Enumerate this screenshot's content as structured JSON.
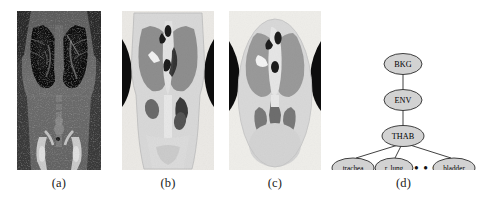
{
  "figure": {
    "panels": [
      {
        "id": "a",
        "caption": "(a)",
        "description": "original coronal CT slice of human torso",
        "kind": "grayscale-ct"
      },
      {
        "id": "b",
        "caption": "(b)",
        "description": "segmented coronal CT slice with labeled regions",
        "kind": "segmentation"
      },
      {
        "id": "c",
        "caption": "(c)",
        "description": "idealized smoothed anatomical segmentation",
        "kind": "idealized-segmentation"
      },
      {
        "id": "d",
        "caption": "(d)",
        "description": "anatomical hierarchy tree",
        "kind": "tree-diagram"
      }
    ]
  },
  "tree": {
    "nodes": [
      {
        "id": "bkg",
        "label": "BKG",
        "level": 0
      },
      {
        "id": "env",
        "label": "ENV",
        "level": 1
      },
      {
        "id": "thab",
        "label": "THAB",
        "level": 2
      },
      {
        "id": "trachea",
        "label": "trachea",
        "level": 3
      },
      {
        "id": "rlung",
        "label": "r. lung",
        "level": 3
      },
      {
        "id": "more",
        "label": "• • •",
        "level": 3
      },
      {
        "id": "bladder",
        "label": "bladder",
        "level": 3
      }
    ],
    "edges": [
      {
        "from": "bkg",
        "to": "env"
      },
      {
        "from": "env",
        "to": "thab"
      },
      {
        "from": "thab",
        "to": "trachea"
      },
      {
        "from": "thab",
        "to": "rlung"
      },
      {
        "from": "thab",
        "to": "bladder"
      }
    ],
    "colors": {
      "node_fill": "#d2d2d2",
      "node_stroke": "#2b2b2b",
      "edge": "#2b2b2b",
      "text": "#000000"
    }
  },
  "colors": {
    "background": "#ffffff",
    "ct_soft_tissue": "#6e6e6e",
    "ct_lung": "#101010",
    "ct_bone": "#d8d8d8",
    "seg_body": "#d9d9d9",
    "seg_lung": "#8f8f8f",
    "seg_air": "#0d0d0d",
    "seg_organ": "#6b6b6b",
    "seg_bone": "#f0f0f0"
  }
}
